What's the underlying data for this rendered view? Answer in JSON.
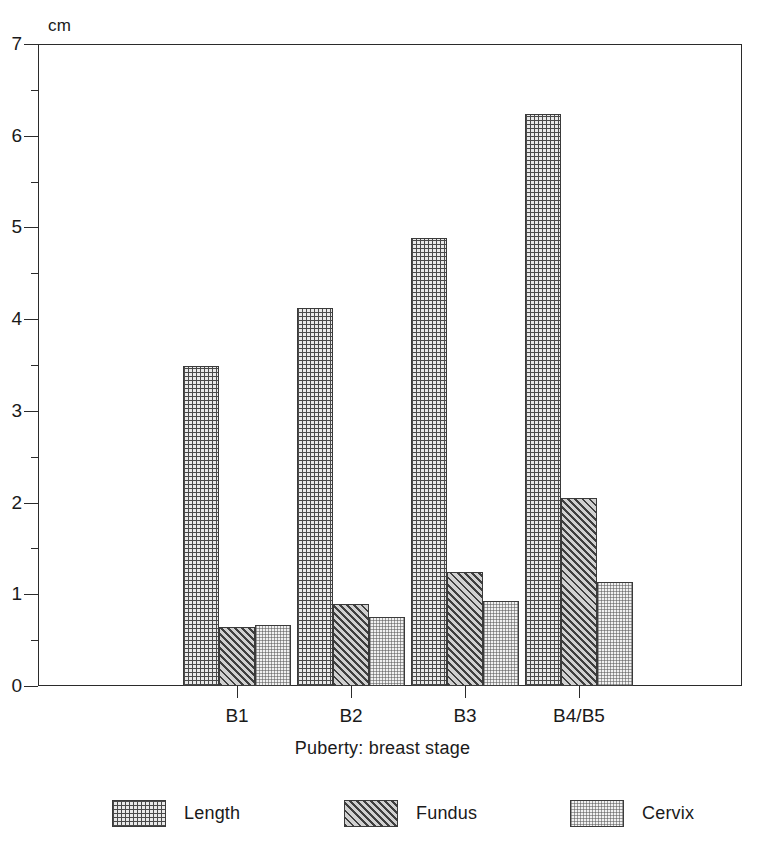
{
  "chart_data": {
    "type": "bar",
    "title": "",
    "xlabel": "Puberty: breast stage",
    "ylabel": "cm",
    "unit_label": "cm",
    "categories": [
      "B1",
      "B2",
      "B3",
      "B4/B5"
    ],
    "series": [
      {
        "name": "Length",
        "values": [
          3.49,
          4.12,
          4.89,
          6.24
        ],
        "pattern": "cross-hatch"
      },
      {
        "name": "Fundus",
        "values": [
          0.64,
          0.89,
          1.24,
          2.05
        ],
        "pattern": "diagonal-hatch"
      },
      {
        "name": "Cervix",
        "values": [
          0.66,
          0.75,
          0.93,
          1.13
        ],
        "pattern": "stipple"
      }
    ],
    "ylim": [
      0,
      7
    ],
    "yticks": [
      0,
      1,
      2,
      3,
      4,
      5,
      6,
      7
    ],
    "ytick_labels": [
      "0",
      "1",
      "2",
      "3",
      "4",
      "5",
      "6",
      "7"
    ],
    "yminor_step": 0.5,
    "grid": false,
    "legend_position": "bottom"
  },
  "legend": {
    "items": [
      {
        "label": "Length"
      },
      {
        "label": "Fundus"
      },
      {
        "label": "Cervix"
      }
    ]
  },
  "colors": {
    "axis": "#2b2b2b",
    "text": "#1a1a1a",
    "background": "#ffffff",
    "length_fill": "#e9e9e9",
    "fundus_fill": "#d0d0d0",
    "cervix_fill": "#f1f1f1"
  }
}
